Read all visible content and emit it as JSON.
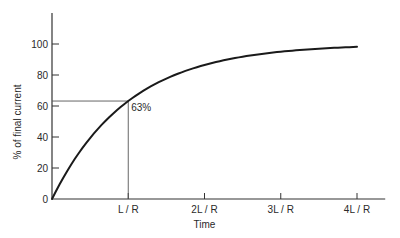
{
  "chart_data": {
    "type": "line",
    "title": "",
    "xlabel": "Time",
    "ylabel": "% of final current",
    "x_ticks": [
      {
        "value": 1,
        "label": "L / R"
      },
      {
        "value": 2,
        "label": "2L / R"
      },
      {
        "value": 3,
        "label": "3L / R"
      },
      {
        "value": 4,
        "label": "4L / R"
      }
    ],
    "y_ticks": [
      {
        "value": 0,
        "label": "0"
      },
      {
        "value": 20,
        "label": "20"
      },
      {
        "value": 40,
        "label": "40"
      },
      {
        "value": 60,
        "label": "60"
      },
      {
        "value": 80,
        "label": "80"
      },
      {
        "value": 100,
        "label": "100"
      }
    ],
    "xlim": [
      0,
      4.37
    ],
    "ylim": [
      0,
      118
    ],
    "grid": false,
    "legend": null,
    "series": [
      {
        "name": "current rise",
        "x": [
          0,
          0.25,
          0.5,
          0.75,
          1,
          1.5,
          2,
          2.5,
          3,
          3.5,
          4
        ],
        "y": [
          0,
          22.1,
          39.3,
          52.8,
          63.2,
          77.7,
          86.5,
          91.8,
          95.0,
          97.0,
          98.2
        ]
      }
    ],
    "annotations": [
      {
        "text": "63%",
        "x": 1,
        "y": 63,
        "guides": "horizontal line from y-axis and vertical line to x-axis at the point"
      }
    ]
  },
  "colors": {
    "line": "#1a1a1a",
    "axis": "#333333",
    "guide": "#555555",
    "text": "#2a2a2a"
  }
}
